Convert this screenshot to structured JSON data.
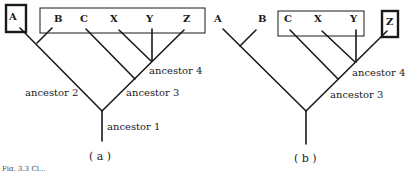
{
  "tree_a": {
    "caption": "( a )",
    "tips": [
      "A",
      "B",
      "C",
      "X",
      "Y",
      "Z"
    ],
    "highlighted_single": "A",
    "boxed_group": [
      "B",
      "C",
      "X",
      "Y",
      "Z"
    ],
    "nodes": {
      "ancestor_1": "ancestor 1",
      "ancestor_2": "ancestor 2",
      "ancestor_3": "ancestor 3",
      "ancestor_4": "ancestor 4"
    }
  },
  "tree_b": {
    "caption": "( b )",
    "tips": [
      "A",
      "B",
      "C",
      "X",
      "Y",
      "Z"
    ],
    "highlighted_single": "Z",
    "boxed_group": [
      "C",
      "X",
      "Y"
    ],
    "nodes": {
      "ancestor_3": "ancestor 3",
      "ancestor_4": "ancestor 4"
    }
  },
  "figure_caption_fragment": "Fig. 3.3  Cl..."
}
